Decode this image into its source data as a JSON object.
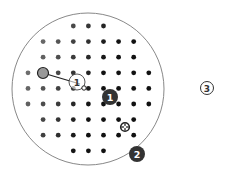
{
  "diagram": {
    "grid": {
      "rows": [
        {
          "cols": [
            3,
            4,
            5
          ]
        },
        {
          "cols": [
            1,
            2,
            3,
            4,
            5,
            6,
            7
          ]
        },
        {
          "cols": [
            1,
            2,
            3,
            4,
            5,
            6,
            7
          ]
        },
        {
          "cols": [
            0,
            1,
            2,
            3,
            4,
            5,
            6,
            7,
            8
          ]
        },
        {
          "cols": [
            0,
            1,
            2,
            3,
            4,
            5,
            6,
            7,
            8
          ]
        },
        {
          "cols": [
            0,
            1,
            2,
            3,
            4,
            5,
            6,
            7,
            8
          ]
        },
        {
          "cols": [
            1,
            2,
            3,
            4,
            5,
            6,
            7
          ]
        },
        {
          "cols": [
            1,
            2,
            3,
            4,
            5,
            6,
            7
          ]
        },
        {
          "cols": [
            3,
            4,
            5
          ]
        }
      ],
      "color_light": "#808080",
      "color_dark": "#111111"
    },
    "selected_dot": {
      "row": 3,
      "col": 1
    },
    "drag_target": {
      "label": "1"
    },
    "markers": [
      {
        "id": "marker-1",
        "label": "1",
        "style": "filled"
      },
      {
        "id": "marker-2",
        "label": "2",
        "style": "filled"
      },
      {
        "id": "marker-3",
        "label": "3",
        "style": "outlined"
      }
    ],
    "colors": {
      "boundary": "#888888",
      "badge_fill": "#333333",
      "badge_text": "#ffffff",
      "outline_text": "#333333"
    }
  }
}
